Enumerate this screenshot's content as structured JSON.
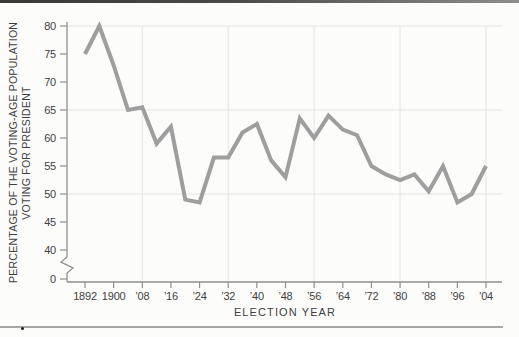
{
  "chart_data": {
    "type": "line",
    "title": "",
    "xlabel": "ELECTION YEAR",
    "ylabel_line1": "PERCENTAGE OF THE VOTING-AGE POPULATION",
    "ylabel_line2": "VOTING FOR PRESIDENT",
    "x": [
      1892,
      1896,
      1900,
      1904,
      1908,
      1912,
      1916,
      1920,
      1924,
      1928,
      1932,
      1936,
      1940,
      1944,
      1948,
      1952,
      1956,
      1960,
      1964,
      1968,
      1972,
      1976,
      1980,
      1984,
      1988,
      1992,
      1996,
      2000,
      2004
    ],
    "values": [
      75,
      80,
      73,
      65,
      65.5,
      59,
      62,
      49,
      48.5,
      56.5,
      56.5,
      61,
      62.5,
      56,
      53,
      63.5,
      60,
      64,
      61.5,
      60.5,
      55,
      53.5,
      52.5,
      53.5,
      50.5,
      55,
      48.5,
      50,
      55
    ],
    "xtick_years": [
      1892,
      1900,
      1908,
      1916,
      1924,
      1932,
      1940,
      1948,
      1956,
      1964,
      1972,
      1980,
      1988,
      1996,
      2004
    ],
    "xtick_labels": [
      "1892",
      "1900",
      "’08",
      "’16",
      "’24",
      "’32",
      "’40",
      "’48",
      "’56",
      "’64",
      "’72",
      "’80",
      "’88",
      "’96",
      "’04"
    ],
    "ytick_values": [
      80,
      75,
      70,
      65,
      60,
      55,
      50,
      45,
      40,
      0
    ],
    "ytick_labels": [
      "80",
      "75",
      "70",
      "65",
      "60",
      "55",
      "50",
      "45",
      "40",
      "0"
    ],
    "ylim_display": [
      40,
      80
    ],
    "axis_break_between": [
      0,
      40
    ],
    "grid": {
      "h_values": [
        80,
        65,
        50
      ],
      "v_years": [
        1908,
        1932,
        1956,
        1980,
        2004
      ],
      "on": true
    },
    "legend": "none",
    "line_color": "#9e9e9e",
    "grid_color": "#e3e4e0",
    "axis_color": "#8f8f8f",
    "text_color": "#3f3f3f"
  }
}
